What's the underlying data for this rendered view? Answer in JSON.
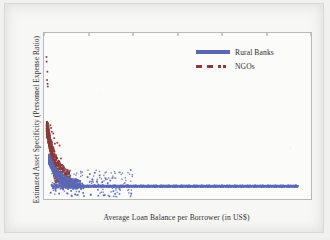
{
  "chart_data": {
    "type": "scatter",
    "title": "",
    "xlabel": "Average Loan Balance per Borrower (in US$)",
    "ylabel": "Estimated Asset Specificity (Personnel Expense Ratio)",
    "xlim": [
      0,
      6000
    ],
    "ylim": [
      0,
      90
    ],
    "xticks": [
      0,
      1000,
      2000,
      3000,
      4000,
      5000,
      6000
    ],
    "yticks": [
      0,
      10,
      20,
      30,
      40,
      50,
      60,
      70,
      80,
      90
    ],
    "grid": false,
    "legend_position": "upper right (inside axes)",
    "colors": {
      "rural_banks": "#5a68b4",
      "ngos": "#8b3a3a",
      "axis_text": "#2f2f2f",
      "plot_border": "#b9b9b5",
      "plot_background": "#fbfbfa",
      "page_background": "#f7f7f5"
    },
    "series": [
      {
        "name": "Rural Banks",
        "color": "#5a68b4",
        "marker": "point",
        "legend_marker": "solid-line",
        "description": "Dense near-flat band of points at asset specificity of about 7, extending from x of about 150 to x of about 5700; a rising tail of points from about y=20 at x=100 down to the band by x=600; sparse scatter between y=0 and y=16 for x below 2000.",
        "points": [
          [
            120,
            21.5
          ],
          [
            130,
            19.8
          ],
          [
            140,
            18.6
          ],
          [
            150,
            17.4
          ],
          [
            160,
            20.2
          ],
          [
            170,
            16.5
          ],
          [
            180,
            15.8
          ],
          [
            190,
            17.1
          ],
          [
            200,
            15.0
          ],
          [
            210,
            14.2
          ],
          [
            215,
            16.0
          ],
          [
            225,
            13.6
          ],
          [
            235,
            13.0
          ],
          [
            245,
            14.5
          ],
          [
            255,
            12.4
          ],
          [
            265,
            11.8
          ],
          [
            275,
            12.9
          ],
          [
            285,
            11.2
          ],
          [
            295,
            10.7
          ],
          [
            305,
            11.9
          ],
          [
            315,
            10.2
          ],
          [
            325,
            9.8
          ],
          [
            335,
            10.9
          ],
          [
            345,
            9.4
          ],
          [
            355,
            9.0
          ],
          [
            365,
            10.1
          ],
          [
            375,
            8.7
          ],
          [
            385,
            8.4
          ],
          [
            395,
            9.3
          ],
          [
            405,
            8.1
          ],
          [
            420,
            7.9
          ],
          [
            435,
            8.6
          ],
          [
            450,
            7.7
          ],
          [
            465,
            7.5
          ],
          [
            480,
            8.2
          ],
          [
            495,
            7.4
          ],
          [
            510,
            7.2
          ],
          [
            525,
            7.8
          ],
          [
            540,
            7.1
          ],
          [
            560,
            7.0
          ],
          [
            580,
            7.5
          ],
          [
            600,
            6.9
          ],
          [
            620,
            7.0
          ],
          [
            640,
            7.2
          ],
          [
            660,
            6.8
          ],
          [
            680,
            7.1
          ],
          [
            700,
            7.0
          ],
          [
            720,
            6.9
          ],
          [
            740,
            7.2
          ],
          [
            760,
            7.0
          ],
          [
            780,
            6.8
          ],
          [
            800,
            7.1
          ],
          [
            830,
            7.0
          ],
          [
            860,
            6.9
          ],
          [
            890,
            7.1
          ],
          [
            920,
            7.0
          ],
          [
            950,
            6.8
          ],
          [
            980,
            7.1
          ],
          [
            1010,
            7.0
          ],
          [
            1040,
            6.9
          ],
          [
            1080,
            7.1
          ],
          [
            1120,
            7.0
          ],
          [
            1160,
            6.9
          ],
          [
            1200,
            7.1
          ],
          [
            1240,
            7.0
          ],
          [
            1280,
            6.9
          ],
          [
            1320,
            7.0
          ],
          [
            1360,
            7.1
          ],
          [
            1400,
            7.0
          ],
          [
            1450,
            6.9
          ],
          [
            1500,
            7.0
          ],
          [
            1550,
            7.1
          ],
          [
            1600,
            7.0
          ],
          [
            1650,
            6.9
          ],
          [
            1700,
            7.0
          ],
          [
            1800,
            7.0
          ],
          [
            1900,
            7.0
          ],
          [
            2000,
            7.0
          ],
          [
            2100,
            7.0
          ],
          [
            2200,
            7.0
          ],
          [
            2300,
            7.0
          ],
          [
            2400,
            7.0
          ],
          [
            2500,
            7.0
          ],
          [
            2600,
            7.0
          ],
          [
            2700,
            7.0
          ],
          [
            2800,
            7.0
          ],
          [
            2900,
            7.0
          ],
          [
            3000,
            7.0
          ],
          [
            3100,
            7.0
          ],
          [
            3200,
            7.0
          ],
          [
            3300,
            7.0
          ],
          [
            3400,
            7.0
          ],
          [
            3500,
            7.0
          ],
          [
            3600,
            7.0
          ],
          [
            3700,
            7.0
          ],
          [
            3800,
            7.0
          ],
          [
            3900,
            7.0
          ],
          [
            4000,
            7.0
          ],
          [
            4100,
            7.0
          ],
          [
            4200,
            7.0
          ],
          [
            4300,
            7.0
          ],
          [
            4400,
            7.0
          ],
          [
            4500,
            7.0
          ],
          [
            4600,
            7.0
          ],
          [
            4700,
            7.0
          ],
          [
            4800,
            7.0
          ],
          [
            4900,
            7.0
          ],
          [
            5000,
            7.0
          ],
          [
            5100,
            7.0
          ],
          [
            5200,
            7.0
          ],
          [
            5300,
            7.0
          ],
          [
            5400,
            7.0
          ],
          [
            5500,
            7.0
          ],
          [
            5600,
            7.0
          ],
          [
            5700,
            7.0
          ],
          [
            150,
            3.4
          ],
          [
            260,
            4.8
          ],
          [
            340,
            2.9
          ],
          [
            430,
            5.2
          ],
          [
            520,
            3.1
          ],
          [
            610,
            4.4
          ],
          [
            700,
            2.6
          ],
          [
            790,
            4.0
          ],
          [
            880,
            3.3
          ],
          [
            980,
            11.9
          ],
          [
            1030,
            13.5
          ],
          [
            1090,
            10.4
          ],
          [
            1140,
            14.2
          ],
          [
            1190,
            9.6
          ],
          [
            1250,
            12.8
          ],
          [
            1310,
            9.1
          ],
          [
            1380,
            11.3
          ],
          [
            1430,
            8.6
          ],
          [
            1490,
            10.0
          ],
          [
            1560,
            4.2
          ],
          [
            620,
            1.9
          ],
          [
            760,
            2.2
          ],
          [
            900,
            1.6
          ],
          [
            1050,
            2.4
          ],
          [
            1220,
            1.8
          ],
          [
            1340,
            2.0
          ],
          [
            1470,
            1.5
          ],
          [
            1600,
            2.8
          ],
          [
            1960,
            3.0
          ],
          [
            1700,
            5.4
          ]
        ]
      },
      {
        "name": "NGOs",
        "color": "#8b3a3a",
        "marker": "point",
        "legend_marker": "dashed-squares",
        "description": "Dense cluster at low loan balance (x below 600) spanning asset specificity of about 10 to 40, with a few high outliers between 60 and 77 at x below 250.",
        "points": [
          [
            55,
            77.0
          ],
          [
            60,
            74.5
          ],
          [
            75,
            69.0
          ],
          [
            70,
            64.5
          ],
          [
            80,
            62.5
          ],
          [
            85,
            61.0
          ],
          [
            95,
            41.0
          ],
          [
            100,
            39.5
          ],
          [
            92,
            38.0
          ],
          [
            110,
            37.5
          ],
          [
            105,
            36.0
          ],
          [
            118,
            35.5
          ],
          [
            88,
            35.0
          ],
          [
            125,
            34.5
          ],
          [
            112,
            34.0
          ],
          [
            98,
            33.5
          ],
          [
            132,
            33.0
          ],
          [
            120,
            32.5
          ],
          [
            108,
            32.0
          ],
          [
            140,
            31.5
          ],
          [
            128,
            31.0
          ],
          [
            115,
            30.5
          ],
          [
            148,
            30.0
          ],
          [
            136,
            29.5
          ],
          [
            122,
            29.0
          ],
          [
            155,
            28.5
          ],
          [
            143,
            28.0
          ],
          [
            130,
            27.5
          ],
          [
            163,
            27.0
          ],
          [
            150,
            26.5
          ],
          [
            138,
            26.0
          ],
          [
            170,
            25.5
          ],
          [
            158,
            25.0
          ],
          [
            145,
            24.5
          ],
          [
            178,
            24.0
          ],
          [
            165,
            23.5
          ],
          [
            152,
            23.0
          ],
          [
            186,
            22.5
          ],
          [
            173,
            22.0
          ],
          [
            160,
            21.5
          ],
          [
            195,
            21.0
          ],
          [
            181,
            20.5
          ],
          [
            168,
            20.0
          ],
          [
            205,
            19.5
          ],
          [
            190,
            19.0
          ],
          [
            176,
            18.5
          ],
          [
            215,
            18.0
          ],
          [
            200,
            17.5
          ],
          [
            185,
            17.0
          ],
          [
            228,
            16.5
          ],
          [
            212,
            16.0
          ],
          [
            196,
            15.5
          ],
          [
            242,
            15.0
          ],
          [
            225,
            14.5
          ],
          [
            208,
            14.0
          ],
          [
            258,
            13.5
          ],
          [
            240,
            13.0
          ],
          [
            222,
            12.5
          ],
          [
            275,
            12.0
          ],
          [
            255,
            11.5
          ],
          [
            236,
            11.0
          ],
          [
            295,
            10.5
          ],
          [
            272,
            10.0
          ],
          [
            250,
            9.8
          ],
          [
            320,
            9.5
          ],
          [
            290,
            9.2
          ],
          [
            265,
            9.0
          ],
          [
            350,
            29.0
          ],
          [
            300,
            30.5
          ],
          [
            380,
            22.0
          ],
          [
            410,
            18.5
          ],
          [
            440,
            15.0
          ],
          [
            470,
            13.0
          ],
          [
            500,
            11.5
          ],
          [
            530,
            10.5
          ],
          [
            560,
            9.6
          ],
          [
            590,
            9.0
          ],
          [
            210,
            35.5
          ],
          [
            230,
            33.0
          ],
          [
            245,
            30.0
          ],
          [
            175,
            36.5
          ],
          [
            160,
            38.5
          ],
          [
            145,
            40.0
          ],
          [
            135,
            28.0
          ],
          [
            190,
            27.0
          ]
        ]
      }
    ]
  },
  "axes": {
    "ytick_labels": [
      "90",
      "80",
      "70",
      "60",
      "50",
      "40",
      "30",
      "20",
      "10",
      "0"
    ],
    "xtick_labels": [
      "0",
      "1000",
      "2000",
      "3000",
      "4000",
      "5000",
      "6000"
    ]
  },
  "legend": {
    "items": [
      {
        "label": "Rural Banks",
        "key": "solid-line-key"
      },
      {
        "label": "NGOs",
        "key": "dashed-square-key"
      }
    ]
  }
}
